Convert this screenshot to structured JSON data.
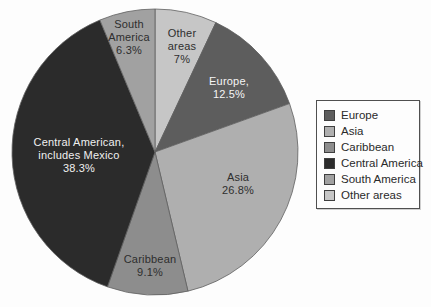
{
  "page": {
    "background": "#fdfdfd",
    "title": ""
  },
  "chart_data": {
    "type": "pie",
    "title": "",
    "start_angle_deg": 0,
    "direction": "clockwise",
    "total": 100,
    "stroke_color": "#5f5f5f",
    "layout": {
      "center_x": 155,
      "center_y": 152,
      "radius": 143,
      "legend_position": "right"
    },
    "slices": [
      {
        "name": "Other areas",
        "value": 7,
        "percent_label": "7%",
        "color": "#c6c6c6",
        "label_lines": [
          "Other",
          "areas",
          "7%"
        ],
        "label_color": "#2e2e2e",
        "label_x": 182,
        "label_y": 46
      },
      {
        "name": "Europe",
        "value": 12.5,
        "percent_label": "12.5%",
        "color": "#5d5d5d",
        "label_lines": [
          "Europe,",
          "12.5%"
        ],
        "label_color": "#f5f5f5",
        "label_x": 229,
        "label_y": 88
      },
      {
        "name": "Asia",
        "value": 26.8,
        "percent_label": "26.8%",
        "color": "#afafaf",
        "label_lines": [
          "Asia",
          "26.8%"
        ],
        "label_color": "#2e2e2e",
        "label_x": 238,
        "label_y": 184
      },
      {
        "name": "Caribbean",
        "value": 9.1,
        "percent_label": "9.1%",
        "color": "#8d8d8d",
        "label_lines": [
          "Caribbean",
          "9.1%"
        ],
        "label_color": "#2e2e2e",
        "label_x": 150,
        "label_y": 266
      },
      {
        "name": "Central America",
        "value": 38.3,
        "percent_label": "38.3%",
        "color": "#2b2b2b",
        "label_lines": [
          "Central American,",
          "includes Mexico",
          "38.3%"
        ],
        "label_color": "#f0f0f0",
        "label_x": 79,
        "label_y": 155
      },
      {
        "name": "South America",
        "value": 6.3,
        "percent_label": "6.3%",
        "color": "#a1a1a1",
        "label_lines": [
          "South",
          "America",
          "6.3%"
        ],
        "label_color": "#2e2e2e",
        "label_x": 129,
        "label_y": 37
      }
    ],
    "legend": {
      "border_color": "#4f4f4f",
      "items": [
        {
          "label": "Europe",
          "color": "#5d5d5d"
        },
        {
          "label": "Asia",
          "color": "#afafaf"
        },
        {
          "label": "Caribbean",
          "color": "#8d8d8d"
        },
        {
          "label": "Central America",
          "color": "#2b2b2b"
        },
        {
          "label": "South America",
          "color": "#a1a1a1"
        },
        {
          "label": "Other areas",
          "color": "#c6c6c6"
        }
      ]
    }
  }
}
